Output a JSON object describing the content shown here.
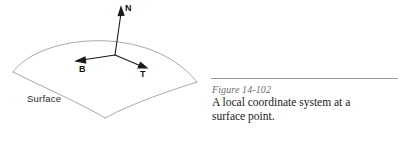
{
  "figure": {
    "surface_label": "Surface",
    "vectors": [
      {
        "name": "normal-vector",
        "label": "N"
      },
      {
        "name": "binormal-vector",
        "label": "B"
      },
      {
        "name": "tangent-vector",
        "label": "T"
      }
    ],
    "stroke_color_surface": "#a9a9a9",
    "stroke_color_vectors": "#1a1a1a"
  },
  "caption": {
    "number": "Figure 14-102",
    "line1": "A local coordinate system at a",
    "line2": "surface point.",
    "rule_color": "#9a9a9a",
    "number_color": "#6e6e6e",
    "text_color": "#1a1a1a"
  }
}
